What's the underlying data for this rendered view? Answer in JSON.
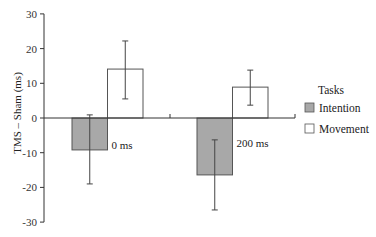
{
  "chart_data": {
    "type": "bar",
    "title": "",
    "xlabel": "",
    "ylabel": "TMS – Sham (ms)",
    "ylim": [
      -30,
      30
    ],
    "yticks": [
      30,
      20,
      10,
      0,
      -10,
      -20,
      -30
    ],
    "categories": [
      "0 ms",
      "200 ms"
    ],
    "legend": {
      "title": "Tasks",
      "position": "right",
      "entries": [
        "Intention",
        "Movement"
      ]
    },
    "grid": false,
    "series": [
      {
        "name": "Intention",
        "color": "#a8a8a8",
        "values": [
          -9.2,
          -16.4
        ],
        "error_low": [
          -19.0,
          -26.5
        ],
        "error_high": [
          0.9,
          -6.3
        ]
      },
      {
        "name": "Movement",
        "color": "#ffffff",
        "values": [
          14.1,
          8.9
        ],
        "error_low": [
          5.5,
          3.7
        ],
        "error_high": [
          22.2,
          13.8
        ]
      }
    ],
    "annotations": [
      "0 ms",
      "200 ms"
    ]
  },
  "axis": {
    "ylabel": "TMS – Sham (ms)"
  },
  "legend": {
    "title": "Tasks",
    "items": [
      {
        "label": "Intention",
        "color": "#a8a8a8"
      },
      {
        "label": "Movement",
        "color": "#ffffff"
      }
    ]
  }
}
